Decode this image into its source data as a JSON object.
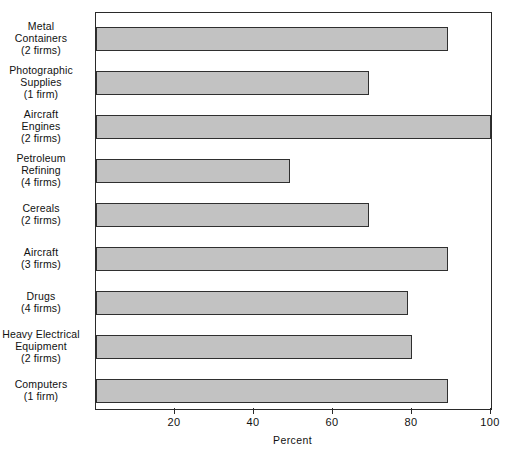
{
  "chart_data": {
    "type": "bar",
    "orientation": "horizontal",
    "title": "",
    "xlabel": "Percent",
    "ylabel": "",
    "xlim": [
      0,
      100
    ],
    "ylim": null,
    "grid": false,
    "legend": null,
    "xticks": [
      20,
      40,
      60,
      80,
      100
    ],
    "xtick_labels": [
      "20",
      "40",
      "60",
      "80",
      "100"
    ],
    "categories": [
      "Metal Containers (2 firms)",
      "Photographic Supplies (1 firm)",
      "Aircraft Engines (2 firms)",
      "Petroleum Refining (4 firms)",
      "Cereals (2 firms)",
      "Aircraft (3 firms)",
      "Drugs (4 firms)",
      "Heavy Electrical Equipment (2 firms)",
      "Computers (1 firm)"
    ],
    "values": [
      89,
      69,
      100,
      49,
      69,
      89,
      79,
      80,
      89
    ],
    "bar_fill_color": "#c2c2c2",
    "bar_edge_color": "#2f2f2f",
    "axis_color": "#2a2a2a",
    "background_color": "#ffffff"
  },
  "category_labels": [
    {
      "name": "Metal\nContainers",
      "firms": "(2 firms)"
    },
    {
      "name": "Photographic\nSupplies",
      "firms": "(1 firm)"
    },
    {
      "name": "Aircraft\nEngines",
      "firms": "(2 firms)"
    },
    {
      "name": "Petroleum\nRefining",
      "firms": "(4 firms)"
    },
    {
      "name": "Cereals",
      "firms": "(2 firms)"
    },
    {
      "name": "Aircraft",
      "firms": "(3 firms)"
    },
    {
      "name": "Drugs",
      "firms": "(4 firms)"
    },
    {
      "name": "Heavy Electrical\nEquipment",
      "firms": "(2 firms)"
    },
    {
      "name": "Computers",
      "firms": "(1 firm)"
    }
  ],
  "axis": {
    "x_title": "Percent"
  }
}
